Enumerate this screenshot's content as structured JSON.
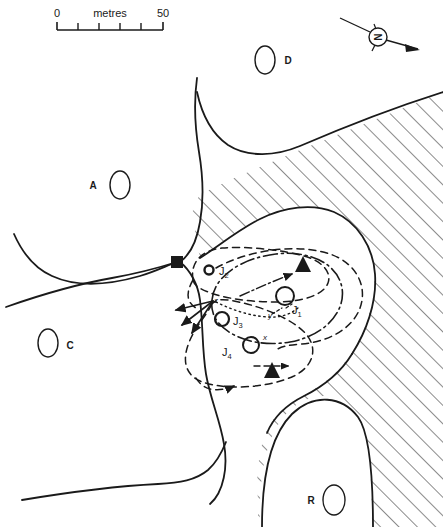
{
  "figure": {
    "type": "site-plan-map",
    "background_color": "#ffffff",
    "line_color": "#1a1a1a"
  },
  "scale_bar": {
    "name": "scale-bar",
    "start_label": "0",
    "unit_label": "metres",
    "end_label": "50",
    "min": 0,
    "max": 50,
    "tick_values": [
      0,
      10,
      20,
      30,
      40,
      50
    ],
    "px_per_unit": 2.12,
    "x_start_px": 57,
    "x_end_px": 163,
    "y_px": 29
  },
  "north_arrow": {
    "name": "north-arrow",
    "glyph": "N",
    "circle_center_px": [
      378,
      37
    ],
    "circle_radius_px": 9,
    "points_direction": "lower-right"
  },
  "zone_labels": [
    {
      "id": "A",
      "label": "A",
      "label_x": 93,
      "label_y": 189,
      "ellipse_cx": 120,
      "ellipse_cy": 185,
      "rx": 10,
      "ry": 14,
      "label_side": "left"
    },
    {
      "id": "D",
      "label": "D",
      "label_x": 288,
      "label_y": 64,
      "ellipse_cx": 265,
      "ellipse_cy": 60,
      "rx": 10,
      "ry": 14,
      "label_side": "right"
    },
    {
      "id": "C",
      "label": "C",
      "label_x": 70,
      "label_y": 349,
      "ellipse_cx": 48,
      "ellipse_cy": 343,
      "rx": 10,
      "ry": 14,
      "label_side": "right"
    },
    {
      "id": "R",
      "label": "R",
      "label_x": 311,
      "label_y": 502,
      "ellipse_cx": 334,
      "ellipse_cy": 500,
      "rx": 11,
      "ry": 15,
      "label_side": "right"
    }
  ],
  "feature_markers": [
    {
      "name": "marker-j1",
      "symbol": "ring",
      "label": "J",
      "subscript": "1",
      "cx": 285,
      "cy": 296,
      "r": 9,
      "label_x": 292,
      "label_y": 313
    },
    {
      "name": "marker-j2",
      "symbol": "ring",
      "label": "J",
      "subscript": "2",
      "cx": 209,
      "cy": 270,
      "r": 5,
      "label_x": 219,
      "label_y": 274
    },
    {
      "name": "marker-j3",
      "symbol": "ring",
      "label": "J",
      "subscript": "3",
      "cx": 222,
      "cy": 319,
      "r": 7,
      "label_x": 232,
      "label_y": 324
    },
    {
      "name": "marker-j4",
      "symbol": "ring",
      "label": "J",
      "subscript": "4",
      "cx": 251,
      "cy": 345,
      "r": 8,
      "label_x": 225,
      "label_y": 354
    }
  ],
  "axis_markers": [
    {
      "name": "axis-label-x",
      "label": "x",
      "x": 263,
      "y": 339
    },
    {
      "name": "axis-label-y",
      "label": "y",
      "x": 270,
      "y": 316
    },
    {
      "name": "axis-label-z",
      "label": "z",
      "x": 215,
      "y": 302
    }
  ],
  "point_symbols": [
    {
      "name": "square-marker",
      "shape": "filled-square",
      "cx": 177,
      "cy": 262,
      "size": 11
    },
    {
      "name": "triangle-marker-north",
      "shape": "filled-triangle",
      "cx": 303,
      "cy": 264,
      "size": 11
    },
    {
      "name": "triangle-marker-south",
      "shape": "filled-triangle",
      "cx": 272,
      "cy": 370,
      "size": 11
    }
  ],
  "hatching": {
    "name": "hatched-bedrock-region",
    "angle_deg": -45,
    "spacing_px": 13,
    "stroke_width": 1
  },
  "legend_text": {
    "units": "metres"
  }
}
